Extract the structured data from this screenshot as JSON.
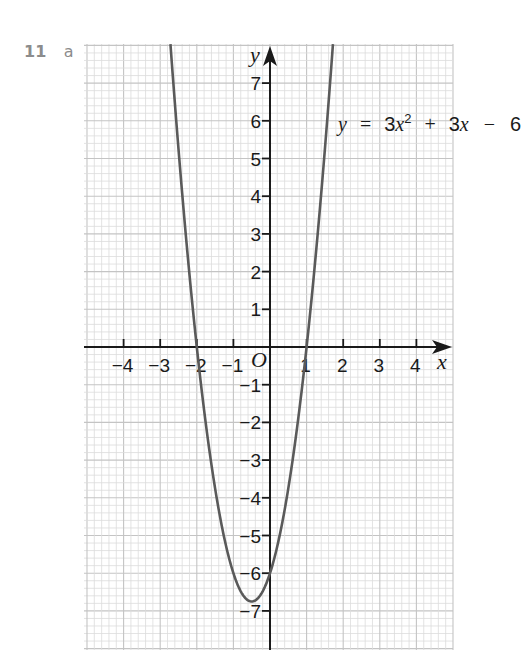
{
  "question": {
    "number": "11",
    "part": "a"
  },
  "chart_data": {
    "type": "line",
    "title": "",
    "equation_label": {
      "lhs": "y",
      "eq": "=",
      "coef_a": "3",
      "var1": "x",
      "exp": "2",
      "plus": "+",
      "coef_b": "3",
      "var2": "x",
      "minus": "−",
      "const": "6"
    },
    "function": {
      "a": 3,
      "b": 3,
      "c": -6
    },
    "xlabel": "x",
    "ylabel": "y",
    "origin_label": "O",
    "xlim": [
      -5,
      5
    ],
    "ylim": [
      -8,
      8
    ],
    "x_ticks": [
      -4,
      -3,
      -2,
      -1,
      1,
      2,
      3,
      4
    ],
    "x_tick_labels": [
      "−4",
      "−3",
      "−2",
      "−1",
      "1",
      "2",
      "3",
      "4"
    ],
    "y_ticks": [
      7,
      6,
      5,
      4,
      3,
      2,
      1,
      -1,
      -2,
      -3,
      -4,
      -5,
      -6,
      -7
    ],
    "y_tick_labels": [
      "7",
      "6",
      "5",
      "4",
      "3",
      "2",
      "1",
      "−1",
      "−2",
      "−3",
      "−4",
      "−5",
      "−6",
      "−7"
    ],
    "grid": true,
    "minor_divisions_per_unit": 5,
    "key_points": [
      {
        "x": -2,
        "y": 0,
        "label": "root"
      },
      {
        "x": 1,
        "y": 0,
        "label": "root"
      },
      {
        "x": 0,
        "y": -6,
        "label": "y-intercept"
      },
      {
        "x": -0.5,
        "y": -6.75,
        "label": "vertex"
      }
    ],
    "series": [
      {
        "name": "y = 3x² + 3x − 6",
        "x": [
          -2.72,
          -2.5,
          -2,
          -1.5,
          -1,
          -0.5,
          0,
          0.5,
          1,
          1.5,
          1.72
        ],
        "y": [
          8,
          5.25,
          0,
          -3.75,
          -6,
          -6.75,
          -6,
          -3.75,
          0,
          5.25,
          8
        ]
      }
    ],
    "colors": {
      "curve": "#5a5a5a",
      "axis": "#1a1a1a",
      "grid_minor": "#dcdcdc",
      "grid_major": "#c4c4c4"
    }
  }
}
